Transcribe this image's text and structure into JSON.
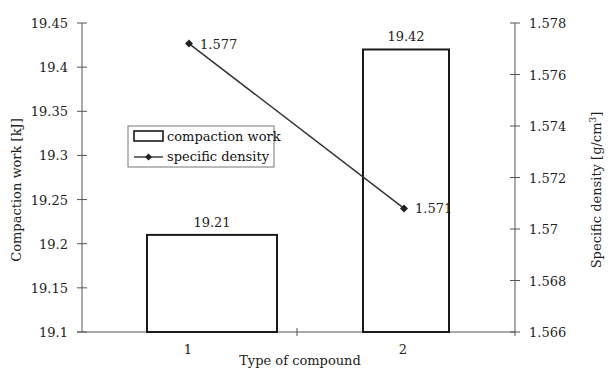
{
  "chart_data": {
    "type": "bar+line",
    "categories": [
      "1",
      "2"
    ],
    "xlabel": "Type of compound",
    "series": [
      {
        "name": "compaction work",
        "type": "bar",
        "axis": "left",
        "values": [
          19.21,
          19.42
        ],
        "labels": [
          "19.21",
          "19.42"
        ]
      },
      {
        "name": "specific density",
        "type": "line",
        "axis": "right",
        "marker": "diamond",
        "values": [
          1.5772,
          1.5708
        ],
        "labels": [
          "1.577",
          "1.571"
        ]
      }
    ],
    "left_axis": {
      "label": "Compaction work [kJ]",
      "ylim": [
        19.1,
        19.45
      ],
      "ticks": [
        19.1,
        19.15,
        19.2,
        19.25,
        19.3,
        19.35,
        19.4,
        19.45
      ],
      "tick_labels": [
        "19.1",
        "19.15",
        "19.2",
        "19.25",
        "19.3",
        "19.35",
        "19.4",
        "19.45"
      ]
    },
    "right_axis": {
      "label_main": "Specific density [g/cm",
      "label_sup": "3",
      "label_end": "]",
      "ylim": [
        1.566,
        1.578
      ],
      "ticks": [
        1.566,
        1.568,
        1.57,
        1.572,
        1.574,
        1.576,
        1.578
      ],
      "tick_labels": [
        "1.566",
        "1.568",
        "1.57",
        "1.572",
        "1.574",
        "1.576",
        "1.578"
      ]
    },
    "legend": {
      "placement": "center-left",
      "entries": [
        "compaction work",
        "specific density"
      ]
    },
    "grid": false,
    "colors": {
      "bar_stroke": "#1a1a1a",
      "bar_fill": "#ffffff",
      "line": "#333333",
      "axis": "#555555"
    }
  }
}
